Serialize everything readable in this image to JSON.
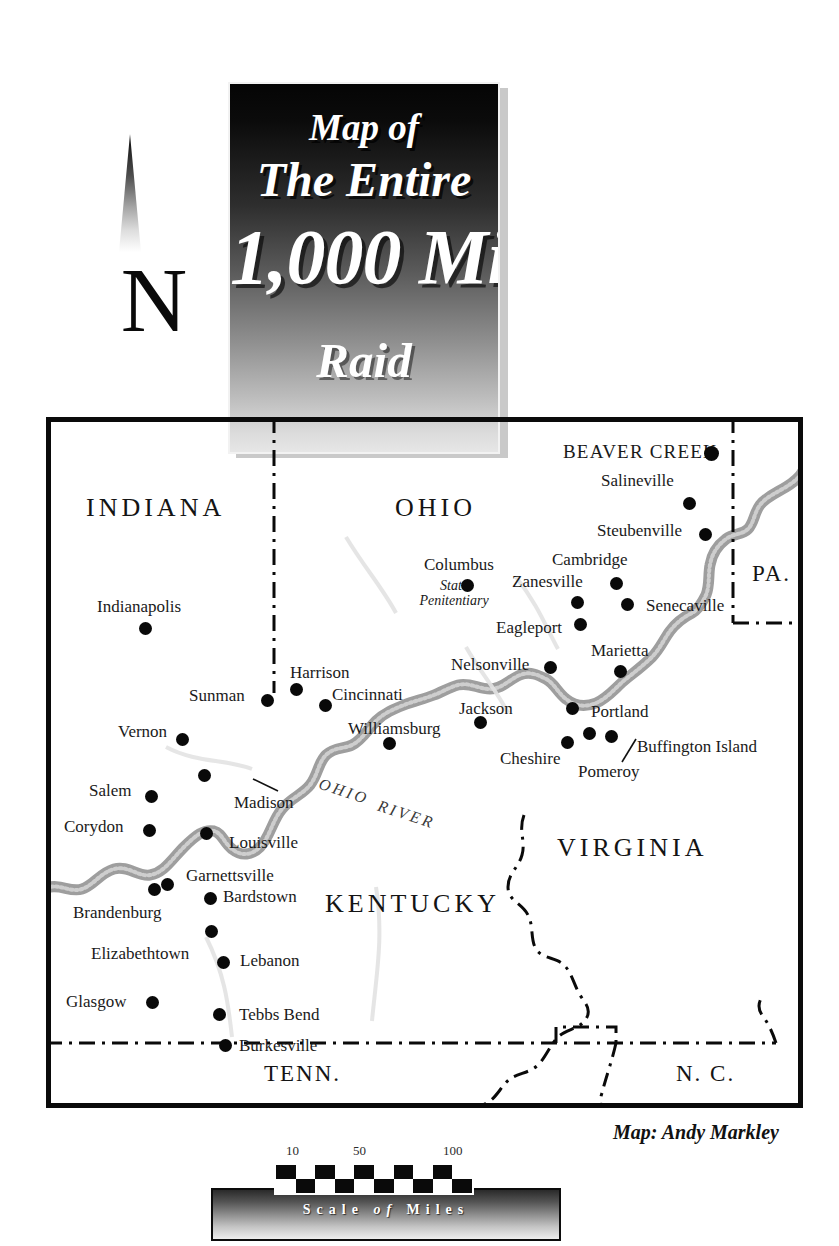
{
  "compass": {
    "letter": "N",
    "icon": "north-arrow-icon"
  },
  "title": {
    "line1": "Map of",
    "line2": "The Entire",
    "line3": "1,000 Mile",
    "line4": "Raid"
  },
  "credit": "Map: Andy Markley",
  "scale": {
    "caption_pre": "Scale",
    "caption_mid": "of",
    "caption_post": "Miles",
    "ticks": [
      "10",
      "50",
      "100"
    ]
  },
  "states": [
    {
      "name": "INDIANA",
      "x": 86,
      "y": 493,
      "size": "large"
    },
    {
      "name": "OHIO",
      "x": 395,
      "y": 493,
      "size": "large"
    },
    {
      "name": "PA.",
      "x": 752,
      "y": 561,
      "size": "small"
    },
    {
      "name": "VIRGINIA",
      "x": 557,
      "y": 833,
      "size": "large"
    },
    {
      "name": "KENTUCKY",
      "x": 325,
      "y": 889,
      "size": "large"
    },
    {
      "name": "TENN.",
      "x": 264,
      "y": 1061,
      "size": "small"
    },
    {
      "name": "N. C.",
      "x": 676,
      "y": 1061,
      "size": "small"
    }
  ],
  "river_label": {
    "word1": "OHIO",
    "word2": "RIVER"
  },
  "cities": [
    {
      "name": "Indianapolis",
      "lx": 97,
      "ly": 597,
      "dx": 146,
      "dy": 629,
      "style": "city"
    },
    {
      "name": "BEAVER CREEK",
      "lx": 563,
      "ly": 441,
      "dx": 711,
      "dy": 453,
      "style": "city-big"
    },
    {
      "name": "Salineville",
      "lx": 601,
      "ly": 471,
      "dx": 690,
      "dy": 504,
      "style": "city"
    },
    {
      "name": "Steubenville",
      "lx": 597,
      "ly": 521,
      "dx": 706,
      "dy": 535,
      "style": "city"
    },
    {
      "name": "Cambridge",
      "lx": 552,
      "ly": 550,
      "dx": 617,
      "dy": 584,
      "style": "city"
    },
    {
      "name": "Zanesville",
      "lx": 512,
      "ly": 572,
      "dx": 578,
      "dy": 603,
      "style": "city"
    },
    {
      "name": "Senecaville",
      "lx": 646,
      "ly": 596,
      "dx": 628,
      "dy": 605,
      "style": "city"
    },
    {
      "name": "Columbus",
      "lx": 424,
      "ly": 555,
      "dx": 468,
      "dy": 586,
      "style": "city"
    },
    {
      "name": "Eagleport",
      "lx": 496,
      "ly": 618,
      "dx": 581,
      "dy": 625,
      "style": "city"
    },
    {
      "name": "Marietta",
      "lx": 591,
      "ly": 641,
      "dx": 621,
      "dy": 672,
      "style": "city"
    },
    {
      "name": "Nelsonville",
      "lx": 451,
      "ly": 655,
      "dx": 551,
      "dy": 668,
      "style": "city"
    },
    {
      "name": "Harrison",
      "lx": 290,
      "ly": 663,
      "dx": 297,
      "dy": 690,
      "style": "city"
    },
    {
      "name": "Cincinnati",
      "lx": 332,
      "ly": 685,
      "dx": 326,
      "dy": 706,
      "style": "city"
    },
    {
      "name": "Sunman",
      "lx": 189,
      "ly": 686,
      "dx": 268,
      "dy": 701,
      "style": "city"
    },
    {
      "name": "Jackson",
      "lx": 459,
      "ly": 699,
      "dx": 481,
      "dy": 723,
      "style": "city"
    },
    {
      "name": "Portland",
      "lx": 591,
      "ly": 702,
      "dx": 573,
      "dy": 709,
      "style": "city"
    },
    {
      "name": "Williamsburg",
      "lx": 348,
      "ly": 719,
      "dx": 390,
      "dy": 744,
      "style": "city"
    },
    {
      "name": "Vernon",
      "lx": 118,
      "ly": 722,
      "dx": 183,
      "dy": 740,
      "style": "city"
    },
    {
      "name": "Buffington Island",
      "lx": 637,
      "ly": 737,
      "dx": 612,
      "dy": 737,
      "style": "city"
    },
    {
      "name": "Cheshire",
      "lx": 500,
      "ly": 749,
      "dx": 568,
      "dy": 743,
      "style": "city"
    },
    {
      "name": "Pomeroy",
      "lx": 578,
      "ly": 762,
      "dx": 590,
      "dy": 734,
      "style": "city"
    },
    {
      "name": "Salem",
      "lx": 89,
      "ly": 781,
      "dx": 152,
      "dy": 797,
      "style": "city"
    },
    {
      "name": "Madison",
      "lx": 234,
      "ly": 793,
      "dx": 205,
      "dy": 776,
      "style": "city"
    },
    {
      "name": "Corydon",
      "lx": 64,
      "ly": 817,
      "dx": 150,
      "dy": 831,
      "style": "city"
    },
    {
      "name": "Louisville",
      "lx": 229,
      "ly": 833,
      "dx": 207,
      "dy": 834,
      "style": "city"
    },
    {
      "name": "Garnettsville",
      "lx": 186,
      "ly": 866,
      "dx": 168,
      "dy": 885,
      "style": "city"
    },
    {
      "name": "Bardstown",
      "lx": 223,
      "ly": 887,
      "dx": 211,
      "dy": 899,
      "style": "city"
    },
    {
      "name": "Brandenburg",
      "lx": 73,
      "ly": 903,
      "dx": 155,
      "dy": 890,
      "style": "city"
    },
    {
      "name": "Elizabethtown",
      "lx": 91,
      "ly": 944,
      "dx": 212,
      "dy": 932,
      "style": "city"
    },
    {
      "name": "Lebanon",
      "lx": 240,
      "ly": 951,
      "dx": 224,
      "dy": 963,
      "style": "city"
    },
    {
      "name": "Glasgow",
      "lx": 66,
      "ly": 992,
      "dx": 153,
      "dy": 1003,
      "style": "city"
    },
    {
      "name": "Tebbs Bend",
      "lx": 239,
      "ly": 1005,
      "dx": 220,
      "dy": 1015,
      "style": "city"
    },
    {
      "name": "Burkesville",
      "lx": 239,
      "ly": 1036,
      "dx": 226,
      "dy": 1046,
      "style": "city"
    }
  ],
  "columbus_sub": {
    "line1": "State",
    "line2": "Penitentiary"
  },
  "colors": {
    "ink": "#0a0a0a",
    "river": "#9a9a9a",
    "frame": "#0a0a0a",
    "paper": "#ffffff"
  }
}
